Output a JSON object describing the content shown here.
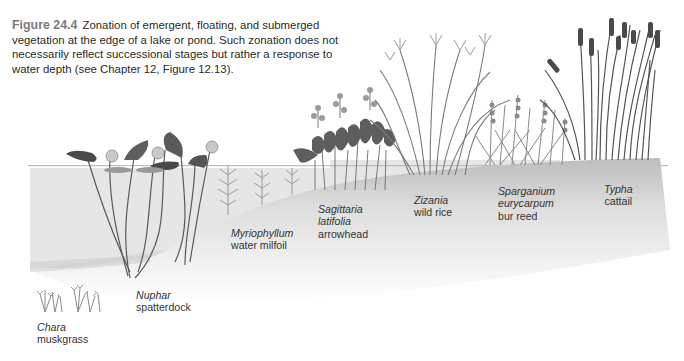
{
  "caption": {
    "figure_number": "Figure 24.4",
    "text": "Zonation of emergent, floating, and submerged vegetation at the edge of a lake or pond. Such zonation does not necessarily reflect successional stages but rather a response to water depth (see Chapter 12, Figure 12.13)."
  },
  "plants": [
    {
      "scientific": "Chara",
      "common": "muskgrass"
    },
    {
      "scientific": "Nuphar",
      "common": "spatterdock"
    },
    {
      "scientific": "Myriophyllum",
      "common": "water milfoil"
    },
    {
      "scientific": "Sagittaria",
      "scientific2": "latifolia",
      "common": "arrowhead"
    },
    {
      "scientific": "Zizania",
      "common": "wild rice"
    },
    {
      "scientific": "Sparganium",
      "scientific2": "eurycarpum",
      "common": "bur reed"
    },
    {
      "scientific": "Typha",
      "common": "cattail"
    }
  ],
  "colors": {
    "water": "#e4e4e4",
    "shore": "#cfcfcf",
    "plant_dark": "#4a4a4a",
    "plant_mid": "#7d7d7d",
    "plant_light": "#a9a9a9",
    "text": "#333333",
    "figure_label": "#7a7a7a"
  }
}
